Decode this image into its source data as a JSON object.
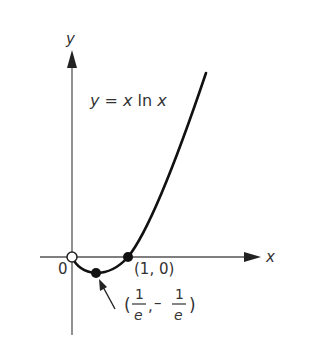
{
  "diagram": {
    "axes": {
      "x_label": "x",
      "y_label": "y",
      "origin_label": "0"
    },
    "equation": {
      "y": "y",
      "eq": " = ",
      "x1": "x",
      "ln": " ln ",
      "x2": "x"
    },
    "points": [
      {
        "label": "(1, 0)",
        "type": "filled"
      },
      {
        "label_num1": "1",
        "label_den1": "e",
        "label_num2": "1",
        "label_den2": "e",
        "type": "filled",
        "description": "(1/e, -1/e)"
      },
      {
        "label": "origin",
        "type": "open"
      }
    ],
    "minimum_label": {
      "open": "(",
      "comma": ",",
      "minus": "–",
      "close": ")"
    },
    "colors": {
      "curve": "#111111",
      "axis": "#555555",
      "text": "#333333"
    }
  }
}
